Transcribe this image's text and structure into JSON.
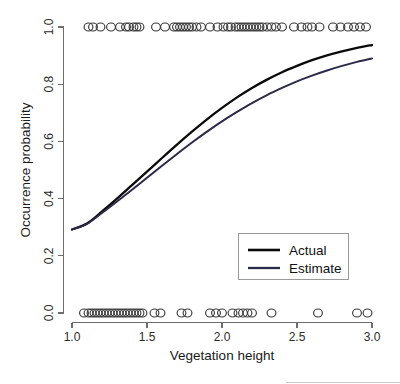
{
  "chart_data": {
    "type": "line",
    "title": "",
    "subtitle": "",
    "xlabel": "Vegetation height",
    "ylabel": "Occurrence probability",
    "xlim": [
      1.0,
      3.0
    ],
    "ylim": [
      0.0,
      1.0
    ],
    "grid": false,
    "legend_position": "inside-lower-right",
    "x_ticks": [
      1.0,
      1.5,
      2.0,
      2.5,
      3.0
    ],
    "x_tick_labels": [
      "1.0",
      "1.5",
      "2.0",
      "2.5",
      "3.0"
    ],
    "y_ticks": [
      0.0,
      0.2,
      0.4,
      0.6,
      0.8,
      1.0
    ],
    "y_tick_labels": [
      "0.0",
      "0.2",
      "0.4",
      "0.6",
      "0.8",
      "1.0"
    ],
    "series": [
      {
        "name": "Actual",
        "color": "#0a0a0a",
        "width": 2.3,
        "x": [
          1.0,
          1.1,
          1.2,
          1.3,
          1.4,
          1.5,
          1.6,
          1.7,
          1.8,
          1.9,
          2.0,
          2.1,
          2.2,
          2.3,
          2.4,
          2.5,
          2.6,
          2.7,
          2.8,
          2.9,
          3.0
        ],
        "values": [
          0.292,
          0.313,
          0.355,
          0.4,
          0.447,
          0.494,
          0.542,
          0.589,
          0.634,
          0.677,
          0.717,
          0.754,
          0.787,
          0.816,
          0.842,
          0.864,
          0.884,
          0.901,
          0.915,
          0.927,
          0.937
        ]
      },
      {
        "name": "Estimate",
        "color": "#2a2a4a",
        "width": 2.0,
        "x": [
          1.0,
          1.1,
          1.2,
          1.3,
          1.4,
          1.5,
          1.6,
          1.7,
          1.8,
          1.9,
          2.0,
          2.1,
          2.2,
          2.3,
          2.4,
          2.5,
          2.6,
          2.7,
          2.8,
          2.9,
          3.0
        ],
        "values": [
          0.292,
          0.312,
          0.35,
          0.39,
          0.431,
          0.473,
          0.515,
          0.556,
          0.596,
          0.634,
          0.67,
          0.703,
          0.734,
          0.762,
          0.787,
          0.81,
          0.83,
          0.848,
          0.864,
          0.878,
          0.89
        ]
      }
    ],
    "rug_top": {
      "label": "presence observations",
      "y": 1.0,
      "x": [
        1.11,
        1.14,
        1.19,
        1.26,
        1.32,
        1.36,
        1.38,
        1.41,
        1.43,
        1.45,
        1.56,
        1.62,
        1.68,
        1.7,
        1.72,
        1.74,
        1.76,
        1.78,
        1.8,
        1.83,
        1.86,
        1.92,
        1.97,
        2.01,
        2.04,
        2.06,
        2.09,
        2.11,
        2.13,
        2.15,
        2.17,
        2.19,
        2.21,
        2.23,
        2.25,
        2.27,
        2.3,
        2.33,
        2.36,
        2.4,
        2.48,
        2.53,
        2.57,
        2.6,
        2.65,
        2.74,
        2.79,
        2.84,
        2.88,
        2.92,
        2.96
      ]
    },
    "rug_bottom": {
      "label": "absence observations",
      "y": 0.0,
      "x": [
        1.08,
        1.11,
        1.13,
        1.15,
        1.17,
        1.19,
        1.21,
        1.23,
        1.25,
        1.27,
        1.29,
        1.31,
        1.33,
        1.35,
        1.37,
        1.39,
        1.41,
        1.43,
        1.45,
        1.47,
        1.55,
        1.59,
        1.73,
        1.77,
        1.92,
        1.96,
        2.0,
        2.07,
        2.11,
        2.14,
        2.17,
        2.2,
        2.33,
        2.64,
        2.9,
        2.97
      ]
    }
  },
  "legend": {
    "entries": [
      {
        "label": "Actual"
      },
      {
        "label": "Estimate"
      }
    ]
  }
}
